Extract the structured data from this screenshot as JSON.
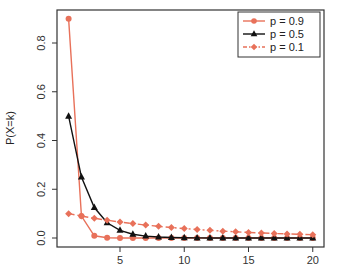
{
  "chart_data": {
    "type": "line",
    "title": "",
    "xlabel": "",
    "ylabel": "P(X=k)",
    "xlim": [
      1,
      20
    ],
    "ylim": [
      0,
      0.9
    ],
    "x_ticks": [
      5,
      10,
      15,
      20
    ],
    "x_tick_labels": [
      "5",
      "10",
      "15",
      "20"
    ],
    "y_ticks": [
      0.0,
      0.2,
      0.4,
      0.6,
      0.8
    ],
    "y_tick_labels": [
      "0.0",
      "0.2",
      "0.4",
      "0.6",
      "0.8"
    ],
    "grid": false,
    "legend_position": "top-right",
    "x": [
      1,
      2,
      3,
      4,
      5,
      6,
      7,
      8,
      9,
      10,
      11,
      12,
      13,
      14,
      15,
      16,
      17,
      18,
      19,
      20
    ],
    "series": [
      {
        "name": "p = 0.9",
        "color": "#e8715a",
        "marker": "circle",
        "line_style": "solid",
        "values": [
          0.9,
          0.09,
          0.009,
          0.0009,
          0.0001,
          0,
          0,
          0,
          0,
          0,
          0,
          0,
          0,
          0,
          0,
          0,
          0,
          0,
          0,
          0
        ]
      },
      {
        "name": "p = 0.5",
        "color": "#111111",
        "marker": "triangle",
        "line_style": "solid",
        "values": [
          0.5,
          0.25,
          0.125,
          0.0625,
          0.0313,
          0.0156,
          0.0078,
          0.0039,
          0.002,
          0.001,
          0.0005,
          0.0002,
          0.0001,
          0.0001,
          0,
          0,
          0,
          0,
          0,
          0
        ]
      },
      {
        "name": "p = 0.1",
        "color": "#e8715a",
        "marker": "diamond",
        "line_style": "dashdot",
        "values": [
          0.1,
          0.09,
          0.081,
          0.0729,
          0.0656,
          0.059,
          0.0531,
          0.0478,
          0.043,
          0.0387,
          0.0349,
          0.0314,
          0.0282,
          0.0254,
          0.0229,
          0.0206,
          0.0185,
          0.0167,
          0.015,
          0.0135
        ]
      }
    ]
  }
}
